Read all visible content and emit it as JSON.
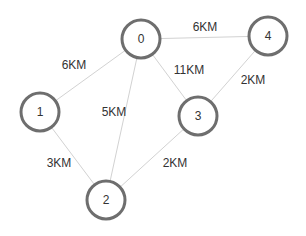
{
  "diagram": {
    "type": "weighted-undirected-graph",
    "colors": {
      "background": "#ffffff",
      "node_stroke": "#6e6e6e",
      "node_fill": "#ffffff",
      "edge_stroke": "#d2d2d2",
      "text": "#333333"
    },
    "node_radius": 19,
    "nodes": [
      {
        "id": "0",
        "label": "0",
        "x": 141,
        "y": 39
      },
      {
        "id": "1",
        "label": "1",
        "x": 40,
        "y": 112
      },
      {
        "id": "2",
        "label": "2",
        "x": 106,
        "y": 200
      },
      {
        "id": "3",
        "label": "3",
        "x": 198,
        "y": 116
      },
      {
        "id": "4",
        "label": "4",
        "x": 268,
        "y": 36
      }
    ],
    "edges": [
      {
        "from": "0",
        "to": "1",
        "label": "6KM",
        "label_x": 74,
        "label_y": 65
      },
      {
        "from": "0",
        "to": "4",
        "label": "6KM",
        "label_x": 205,
        "label_y": 27
      },
      {
        "from": "0",
        "to": "2",
        "label": "5KM",
        "label_x": 114,
        "label_y": 112
      },
      {
        "from": "0",
        "to": "3",
        "label": "11KM",
        "label_x": 189,
        "label_y": 70
      },
      {
        "from": "4",
        "to": "3",
        "label": "2KM",
        "label_x": 253,
        "label_y": 80
      },
      {
        "from": "1",
        "to": "2",
        "label": "3KM",
        "label_x": 59,
        "label_y": 163
      },
      {
        "from": "3",
        "to": "2",
        "label": "2KM",
        "label_x": 175,
        "label_y": 163
      }
    ]
  }
}
